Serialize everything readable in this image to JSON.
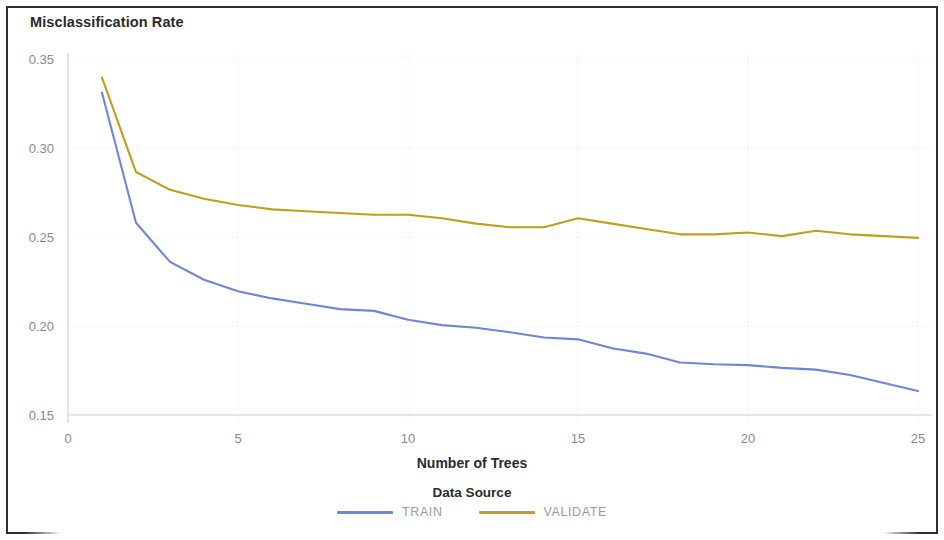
{
  "chart_data": {
    "type": "line",
    "title": "Misclassification Rate",
    "xlabel": "Number of Trees",
    "ylabel": "",
    "xlim": [
      0,
      25
    ],
    "ylim": [
      0.15,
      0.35
    ],
    "grid": true,
    "legend_title": "Data Source",
    "legend_position": "bottom",
    "xticks": [
      "0",
      "5",
      "10",
      "15",
      "20",
      "25"
    ],
    "xtick_values": [
      0,
      5,
      10,
      15,
      20,
      25
    ],
    "yticks": [
      "0.15",
      "0.20",
      "0.25",
      "0.30",
      "0.35"
    ],
    "ytick_values": [
      0.15,
      0.2,
      0.25,
      0.3,
      0.35
    ],
    "x": [
      1,
      2,
      3,
      4,
      5,
      6,
      7,
      8,
      9,
      10,
      11,
      12,
      13,
      14,
      15,
      16,
      17,
      18,
      19,
      20,
      21,
      22,
      23,
      24,
      25
    ],
    "series": [
      {
        "name": "TRAIN",
        "color": "#6f86d6",
        "values": [
          0.331,
          0.258,
          0.236,
          0.226,
          0.2195,
          0.2155,
          0.2125,
          0.2095,
          0.2085,
          0.2035,
          0.2005,
          0.199,
          0.1965,
          0.1935,
          0.1925,
          0.1875,
          0.1845,
          0.1795,
          0.1785,
          0.178,
          0.1765,
          0.1755,
          0.1725,
          0.168,
          0.1635
        ]
      },
      {
        "name": "VALIDATE",
        "color": "#bfa01c",
        "values": [
          0.3395,
          0.2865,
          0.2765,
          0.2715,
          0.268,
          0.2655,
          0.2645,
          0.2635,
          0.2625,
          0.2625,
          0.2605,
          0.2575,
          0.2555,
          0.2555,
          0.2605,
          0.2575,
          0.2545,
          0.2515,
          0.2515,
          0.2525,
          0.2505,
          0.2535,
          0.2515,
          0.2505,
          0.2495
        ]
      }
    ]
  },
  "legend": {
    "title": "Data Source",
    "items": [
      {
        "label": "TRAIN",
        "color": "#6f86d6"
      },
      {
        "label": "VALIDATE",
        "color": "#bfa01c"
      }
    ]
  },
  "axes": {
    "x_title": "Number of Trees",
    "y_title": "Misclassification Rate"
  }
}
